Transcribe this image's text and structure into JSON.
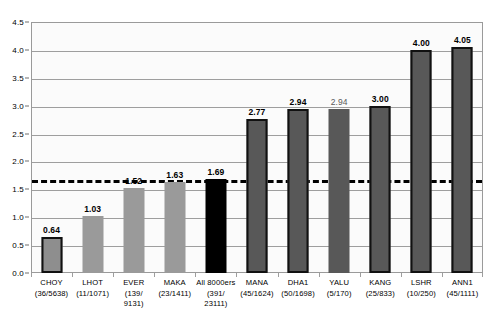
{
  "chart_data": {
    "type": "bar",
    "title": "",
    "subtitle": "",
    "xlabel": "",
    "ylabel": "",
    "ylim": [
      0.0,
      4.5
    ],
    "yticks": [
      "0.0",
      "0.5",
      "1.0",
      "1.5",
      "2.0",
      "2.5",
      "3.0",
      "3.5",
      "4.0",
      "4.5"
    ],
    "ytick_values": [
      0.0,
      0.5,
      1.0,
      1.5,
      2.0,
      2.5,
      3.0,
      3.5,
      4.0,
      4.5
    ],
    "grid": "horizontal",
    "legend": "none",
    "categories": [
      "CHOY",
      "LHOT",
      "EVER",
      "MAKA",
      "All 8000ers",
      "MANA",
      "DHA1",
      "YALU",
      "KANG",
      "LSHR",
      "ANN1"
    ],
    "values": [
      0.64,
      1.03,
      1.52,
      1.63,
      1.69,
      2.77,
      2.94,
      2.94,
      3.0,
      4.0,
      4.05
    ],
    "value_labels": [
      "0.64",
      "1.03",
      "1.52",
      "1.63",
      "1.69",
      "2.77",
      "2.94",
      "2.94",
      "3.00",
      "4.00",
      "4.05"
    ],
    "category_sublabels": [
      "(36/5638)",
      "(11/1071)",
      "(139/\n9131)",
      "(23/1411)",
      "(391/\n23111)",
      "(45/1624)",
      "(50/1698)",
      "(5/170)",
      "(25/833)",
      "(10/250)",
      "(45/1111)"
    ],
    "annotations": [
      {
        "name": "overall-reference-line",
        "type": "hline",
        "value": 1.69,
        "style": "dashed",
        "color": "#000000"
      }
    ],
    "bars": [
      {
        "label": "CHOY",
        "sublabel": "(36/5638)",
        "value": 0.64,
        "value_label": "0.64",
        "style": "light bordered",
        "label_emphasis": "bold"
      },
      {
        "label": "LHOT",
        "sublabel": "(11/1071)",
        "value": 1.03,
        "value_label": "1.03",
        "style": "medium",
        "label_emphasis": "bold"
      },
      {
        "label": "EVER",
        "sublabel": "(139/\n9131)",
        "value": 1.52,
        "value_label": "1.52",
        "style": "medium",
        "label_emphasis": "bold"
      },
      {
        "label": "MAKA",
        "sublabel": "(23/1411)",
        "value": 1.63,
        "value_label": "1.63",
        "style": "medium",
        "label_emphasis": "bold"
      },
      {
        "label": "All 8000ers",
        "sublabel": "(391/\n23111)",
        "value": 1.69,
        "value_label": "1.69",
        "style": "black",
        "label_emphasis": "bold"
      },
      {
        "label": "MANA",
        "sublabel": "(45/1624)",
        "value": 2.77,
        "value_label": "2.77",
        "style": "dark bordered",
        "label_emphasis": "bold"
      },
      {
        "label": "DHA1",
        "sublabel": "(50/1698)",
        "value": 2.94,
        "value_label": "2.94",
        "style": "dark bordered",
        "label_emphasis": "bold"
      },
      {
        "label": "YALU",
        "sublabel": "(5/170)",
        "value": 2.94,
        "value_label": "2.94",
        "style": "dark",
        "label_emphasis": "plain"
      },
      {
        "label": "KANG",
        "sublabel": "(25/833)",
        "value": 3.0,
        "value_label": "3.00",
        "style": "dark bordered",
        "label_emphasis": "bold"
      },
      {
        "label": "LSHR",
        "sublabel": "(10/250)",
        "value": 4.0,
        "value_label": "4.00",
        "style": "dark bordered",
        "label_emphasis": "bold"
      },
      {
        "label": "ANN1",
        "sublabel": "(45/1111)",
        "value": 4.05,
        "value_label": "4.05",
        "style": "dark bordered",
        "label_emphasis": "bold"
      }
    ],
    "colors": {
      "light_bar": "#8e8e8e",
      "medium_bar": "#9a9a9a",
      "dark_bar": "#585858",
      "black_bar": "#000000",
      "bar_border": "#111111",
      "gridline": "#9e9e9e",
      "plot_background": "#fbfbfb",
      "plot_border": "#9a9a9a",
      "reference_line": "#000000",
      "text": "#000000"
    }
  }
}
